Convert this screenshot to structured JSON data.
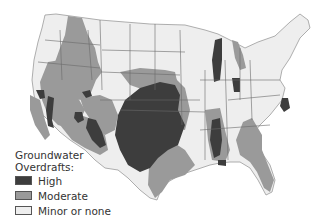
{
  "legend": {
    "title_line1": "Groundwater",
    "title_line2": "Overdrafts:",
    "items": [
      {
        "label": "High",
        "color": "#3d3d3d"
      },
      {
        "label": "Moderate",
        "color": "#9a9a9a"
      },
      {
        "label": "Minor or none",
        "color": "#eeeeee"
      }
    ]
  },
  "map": {
    "subject": "Contiguous United States",
    "base_color": "#eeeeee",
    "border_color": "#6a6a6a"
  }
}
